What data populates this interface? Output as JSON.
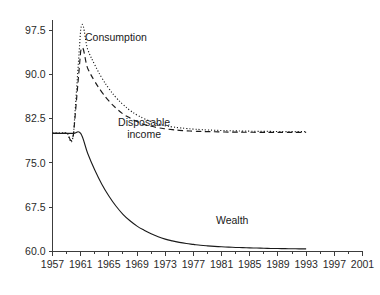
{
  "chart_data": {
    "type": "line",
    "title": "",
    "subtitle": "",
    "xlabel": "",
    "ylabel": "",
    "xlim": [
      1957,
      2001
    ],
    "ylim": [
      60.0,
      99.2
    ],
    "grid": false,
    "legend": "inline-annotations",
    "x_ticks": [
      1957,
      1961,
      1965,
      1969,
      1973,
      1977,
      1981,
      1985,
      1989,
      1993,
      1997,
      2001
    ],
    "x_tick_labels": [
      "1957",
      "1961",
      "1965",
      "1969",
      "1973",
      "1977",
      "1981",
      "1985",
      "1989",
      "1993",
      "1997",
      "2001"
    ],
    "y_ticks": [
      60.0,
      67.5,
      75.0,
      82.5,
      90.0,
      97.5
    ],
    "y_tick_labels": [
      "60.0",
      "67.5",
      "75.0",
      "82.5",
      "90.0",
      "97.5"
    ],
    "x": [
      1957,
      1958,
      1959,
      1960,
      1961,
      1962,
      1963,
      1964,
      1965,
      1966,
      1967,
      1968,
      1969,
      1970,
      1971,
      1972,
      1973,
      1974,
      1975,
      1976,
      1977,
      1978,
      1979,
      1980,
      1981,
      1982,
      1983,
      1984,
      1985,
      1986,
      1987,
      1988,
      1989,
      1990,
      1991,
      1992,
      1993
    ],
    "series": [
      {
        "name": "Consumption",
        "style": "dotted",
        "label_x": 1966.0,
        "label_y": 95.6,
        "values": [
          80.1,
          80.1,
          80.1,
          80.1,
          97.6,
          94.2,
          91.6,
          89.4,
          87.6,
          86.1,
          84.9,
          83.9,
          83.1,
          82.5,
          82.0,
          81.6,
          81.3,
          81.1,
          80.95,
          80.83,
          80.73,
          80.65,
          80.58,
          80.53,
          80.48,
          80.45,
          80.42,
          80.39,
          80.37,
          80.35,
          80.34,
          80.33,
          80.32,
          80.31,
          80.3,
          80.3,
          80.3
        ]
      },
      {
        "name": "Disposable income",
        "style": "dashed",
        "label_x": 1970.0,
        "label_y": 81.2,
        "values": [
          80.0,
          80.0,
          80.0,
          80.0,
          93.9,
          91.0,
          88.8,
          87.0,
          85.5,
          84.3,
          83.3,
          82.6,
          82.0,
          81.5,
          81.2,
          80.95,
          80.77,
          80.63,
          80.52,
          80.44,
          80.38,
          80.33,
          80.3,
          80.27,
          80.24,
          80.22,
          80.21,
          80.2,
          80.19,
          80.18,
          80.18,
          80.17,
          80.17,
          80.16,
          80.16,
          80.16,
          80.16
        ]
      },
      {
        "name": "Wealth",
        "style": "solid",
        "label_x": 1982.5,
        "label_y": 64.6,
        "values": [
          80.0,
          80.0,
          80.0,
          80.0,
          80.0,
          76.6,
          73.8,
          71.4,
          69.4,
          67.7,
          66.3,
          65.2,
          64.3,
          63.6,
          63.0,
          62.5,
          62.1,
          61.8,
          61.55,
          61.35,
          61.2,
          61.05,
          60.95,
          60.87,
          60.8,
          60.74,
          60.69,
          60.65,
          60.61,
          60.58,
          60.55,
          60.52,
          60.5,
          60.48,
          60.46,
          60.45,
          60.44
        ]
      }
    ]
  }
}
